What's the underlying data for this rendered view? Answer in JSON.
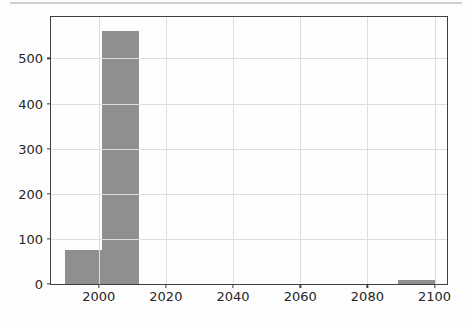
{
  "page": {
    "background_color": "#fdfdfd",
    "top_divider_color": "#cfcfcf"
  },
  "chart_data": {
    "type": "bar",
    "subtype": "histogram",
    "title": "",
    "xlabel": "",
    "ylabel": "",
    "bin_edges": [
      1990,
      2001,
      2012,
      2023,
      2034,
      2045,
      2056,
      2067,
      2078,
      2089,
      2100
    ],
    "counts": [
      75,
      560,
      0,
      0,
      0,
      0,
      0,
      0,
      0,
      8
    ],
    "x_ticks": [
      2000,
      2020,
      2040,
      2060,
      2080,
      2100
    ],
    "y_ticks": [
      0,
      100,
      200,
      300,
      400,
      500
    ],
    "xlim": [
      1985.8,
      2103.7
    ],
    "ylim": [
      0,
      592
    ],
    "grid": true,
    "legend": null,
    "colors": {
      "bar": "#8f8f8f",
      "grid": "#dedede",
      "spine": "#404040",
      "tick": "#404040",
      "tick_label": "#262626",
      "plot_background": "#fdfdfd"
    }
  }
}
